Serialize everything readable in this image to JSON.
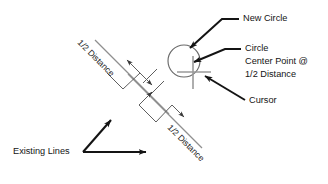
{
  "diagram": {
    "labels": {
      "new_circle": "New Circle",
      "circle_center_line1": "Circle",
      "circle_center_line2": "Center Point @",
      "circle_center_line3": "1/2 Distance",
      "cursor": "Cursor",
      "existing_lines": "Existing Lines",
      "half_distance_upper": "1/2 Distance",
      "half_distance_lower": "1/2 Distance"
    },
    "colors": {
      "background": "#ffffff",
      "text": "#141414",
      "existing_line": "#8f8f8f",
      "dimension_line": "#5f5f5f",
      "circle_stroke": "#6a6a6a",
      "cursor": "#9a9a9a",
      "leader": "#141414"
    },
    "geometry": {
      "existing_line_upper": {
        "x1": 95,
        "y1": 40,
        "x2": 168,
        "y2": 113
      },
      "existing_line_lower": {
        "x1": 128,
        "y1": 73,
        "x2": 201,
        "y2": 146
      },
      "new_circle": {
        "cx": 184,
        "cy": 61,
        "r": 16
      },
      "cursor_center": {
        "x": 193,
        "y": 72
      }
    }
  }
}
